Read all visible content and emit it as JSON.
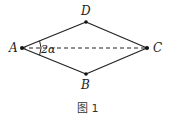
{
  "figure": {
    "caption": "图 1",
    "points": {
      "A": {
        "label": "A",
        "x": 22,
        "y": 48
      },
      "B": {
        "label": "B",
        "x": 86,
        "y": 74
      },
      "C": {
        "label": "C",
        "x": 147,
        "y": 48
      },
      "D": {
        "label": "D",
        "x": 86,
        "y": 22
      }
    },
    "edges": [
      {
        "from": "A",
        "to": "D",
        "style": "solid"
      },
      {
        "from": "D",
        "to": "C",
        "style": "solid"
      },
      {
        "from": "C",
        "to": "B",
        "style": "solid"
      },
      {
        "from": "B",
        "to": "A",
        "style": "solid"
      },
      {
        "from": "A",
        "to": "C",
        "style": "dashed"
      }
    ],
    "angle_label": "2α",
    "colors": {
      "line": "#222222",
      "background": "#ffffff"
    }
  }
}
